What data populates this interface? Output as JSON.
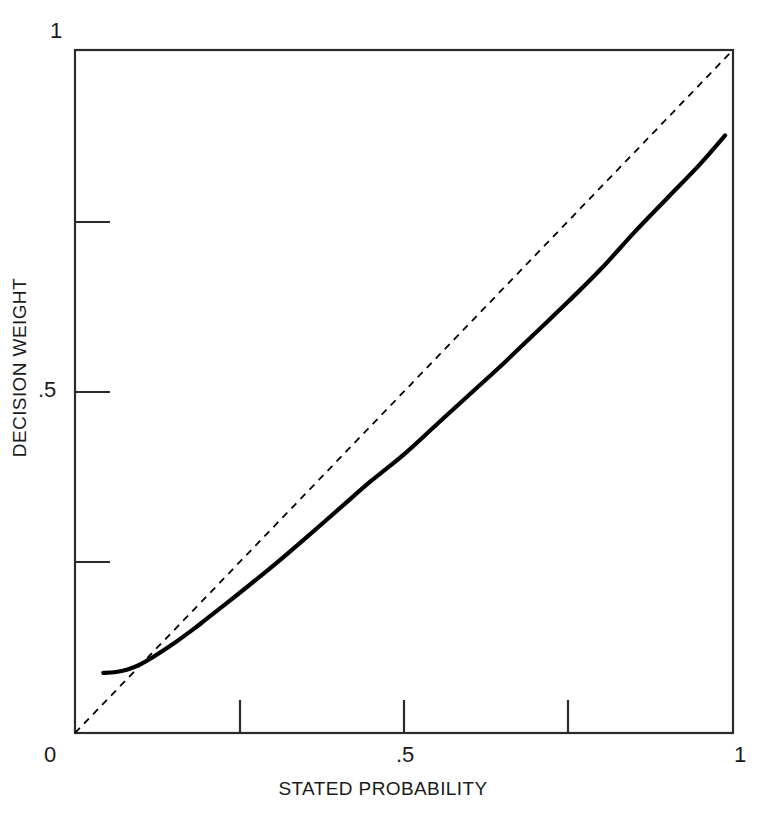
{
  "chart_data": {
    "type": "line",
    "title": "",
    "xlabel": "STATED PROBABILITY",
    "ylabel": "DECISION WEIGHT",
    "xlim": [
      0,
      1
    ],
    "ylim": [
      0,
      1
    ],
    "grid": false,
    "legend": "none",
    "x_tick_labels": [
      "0",
      ".5",
      "1"
    ],
    "x_tick_values": [
      0,
      0.5,
      1
    ],
    "x_tick_marks": [
      0,
      0.25,
      0.5,
      0.75,
      1
    ],
    "y_tick_labels": [
      "0",
      ".5",
      "1"
    ],
    "y_tick_values": [
      0,
      0.5,
      1
    ],
    "y_tick_marks": [
      0,
      0.25,
      0.5,
      0.75,
      1
    ],
    "series": [
      {
        "name": "decision weight curve",
        "style": "solid",
        "color": "#000000",
        "x": [
          0.043,
          0.06,
          0.08,
          0.1,
          0.12,
          0.15,
          0.18,
          0.2,
          0.25,
          0.3,
          0.35,
          0.4,
          0.45,
          0.5,
          0.55,
          0.6,
          0.65,
          0.7,
          0.75,
          0.8,
          0.85,
          0.9,
          0.95,
          0.988
        ],
        "y": [
          0.088,
          0.089,
          0.093,
          0.101,
          0.112,
          0.131,
          0.152,
          0.167,
          0.205,
          0.244,
          0.285,
          0.327,
          0.369,
          0.408,
          0.452,
          0.496,
          0.54,
          0.586,
          0.632,
          0.68,
          0.733,
          0.783,
          0.833,
          0.875
        ]
      },
      {
        "name": "identity line",
        "style": "dashed",
        "color": "#000000",
        "x": [
          0,
          1
        ],
        "y": [
          0,
          1
        ]
      }
    ]
  },
  "axes": {
    "x_title": "STATED PROBABILITY",
    "y_title": "DECISION WEIGHT",
    "x_labels": {
      "min": "0",
      "mid": ".5",
      "max": "1"
    },
    "y_labels": {
      "min": "0",
      "mid": ".5",
      "max": "1"
    }
  },
  "colors": {
    "axis": "#2b2b2b",
    "curve": "#000000",
    "diagonal": "#111111",
    "background": "#ffffff",
    "text": "#1a1a1a"
  }
}
